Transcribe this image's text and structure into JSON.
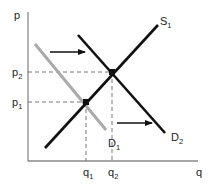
{
  "diagram": {
    "title": "",
    "axes": {
      "y_label": "p",
      "x_label": "q",
      "color": "#888888"
    },
    "curves": {
      "supply": {
        "label": "S",
        "subscript": "1",
        "color": "#111111"
      },
      "demand_initial": {
        "label": "D",
        "subscript": "1",
        "color": "#aaaaaa"
      },
      "demand_shifted": {
        "label": "D",
        "subscript": "2",
        "color": "#111111"
      }
    },
    "price_ticks": [
      {
        "label": "p",
        "subscript": "2"
      },
      {
        "label": "p",
        "subscript": "1"
      }
    ],
    "quantity_ticks": [
      {
        "label": "q",
        "subscript": "1"
      },
      {
        "label": "q",
        "subscript": "2"
      }
    ],
    "shift_arrows": [
      {
        "direction": "right",
        "meaning": "demand shift"
      },
      {
        "direction": "right",
        "meaning": "demand shift"
      }
    ],
    "equilibria": [
      {
        "name": "initial",
        "price": "p1",
        "quantity": "q1"
      },
      {
        "name": "new",
        "price": "p2",
        "quantity": "q2"
      }
    ]
  }
}
